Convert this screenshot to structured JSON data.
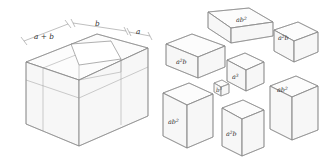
{
  "figure": {
    "line_color": "#8a8a8a",
    "face_color": "#ffffff",
    "text_color": "#333333"
  },
  "left_diagram": {
    "name": "assembled-cube",
    "dimension_labels": [
      {
        "id": "a-plus-b",
        "base": "a",
        "op": " + ",
        "base2": "b",
        "text": "a + b"
      },
      {
        "id": "b",
        "base": "b",
        "text": "b"
      },
      {
        "id": "a",
        "base": "a",
        "text": "a"
      }
    ]
  },
  "right_diagram": {
    "name": "exploded-pieces",
    "pieces": [
      {
        "id": "piece-top-ab2",
        "base": "ab",
        "exp": "2",
        "text": "ab2"
      },
      {
        "id": "piece-topright-a2b",
        "base": "a",
        "exp": "2",
        "tail": "b",
        "text": "a2b"
      },
      {
        "id": "piece-left-a2b",
        "base": "a",
        "exp": "2",
        "tail": "b",
        "text": "a2b"
      },
      {
        "id": "piece-center-a3",
        "base": "a",
        "exp": "3",
        "text": "a3"
      },
      {
        "id": "piece-b3",
        "base": "b",
        "exp": "3",
        "text": "b3"
      },
      {
        "id": "piece-right-ab2",
        "base": "ab",
        "exp": "2",
        "text": "ab2"
      },
      {
        "id": "piece-bottomleft-ab2",
        "base": "ab",
        "exp": "2",
        "text": "ab2"
      },
      {
        "id": "piece-bottom-a2b",
        "base": "a",
        "exp": "2",
        "tail": "b",
        "text": "a2b"
      }
    ]
  },
  "labels": {
    "a_plus_b_a": "a",
    "a_plus_b_op": "+",
    "a_plus_b_b": "b",
    "b": "b",
    "a": "a",
    "ab2_base": "ab",
    "ab2_exp": "2",
    "a2b_base": "a",
    "a2b_exp": "2",
    "a2b_tail": "b",
    "a3_base": "a",
    "a3_exp": "3",
    "b3_base": "b",
    "b3_exp": "3"
  }
}
